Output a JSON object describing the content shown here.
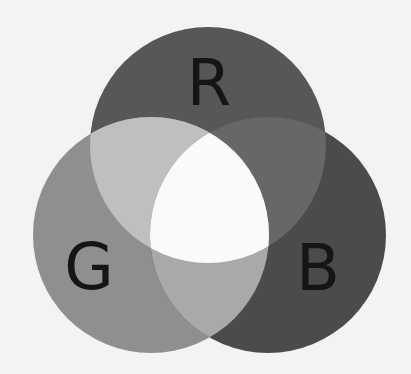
{
  "diagram": {
    "type": "venn",
    "title": "",
    "background": "#f3f3f3",
    "radius": 118,
    "circles": [
      {
        "id": "red",
        "label": "R",
        "cx": 208,
        "cy": 145,
        "fill": "#575757",
        "label_x": 209,
        "label_y": 105
      },
      {
        "id": "green",
        "label": "G",
        "cx": 151,
        "cy": 235,
        "fill": "#8f8f8f",
        "label_x": 89,
        "label_y": 289
      },
      {
        "id": "blue",
        "label": "B",
        "cx": 268,
        "cy": 235,
        "fill": "#4b4b4b",
        "label_x": 318,
        "label_y": 290
      }
    ],
    "overlaps": {
      "red_green": "#bfbfbf",
      "red_blue": "#676767",
      "green_blue": "#a9a9a9",
      "center": "#fafafa"
    },
    "label_color": "#151515",
    "label_font_size": 64
  }
}
